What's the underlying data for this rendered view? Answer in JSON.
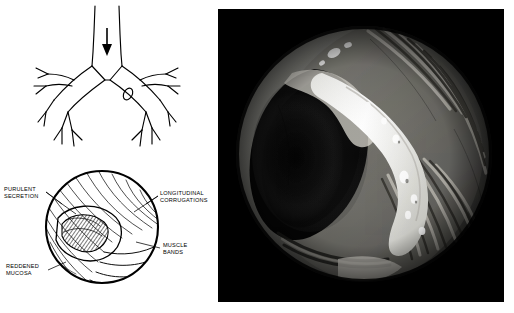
{
  "figure": {
    "caption": "",
    "panels": {
      "left": {
        "name": "schematic-diagram-panel",
        "upper": {
          "name": "tracheobronchial-tree-schematic",
          "description": "Line drawing of trachea with bifurcation into main bronchi and branching lobar bronchi; a downward arrow marks the lower trachea, and a small oval marks a site on the right main bronchus",
          "arrow_label": "",
          "marker_label": ""
        },
        "lower": {
          "name": "circular-detail-inset",
          "description": "Circular magnified view of the bronchial lumen showing mucosal detail",
          "labels": [
            {
              "id": "purulent-secretion",
              "text": "PURULENT\nSECRETION"
            },
            {
              "id": "longitudinal-corrugations",
              "text": "LONGITUDINAL\nCORRUGATIONS"
            },
            {
              "id": "muscle-bands",
              "text": "MUSCLE\nBANDS"
            },
            {
              "id": "reddened-mucosa",
              "text": "REDDENED\nMUCOSA"
            }
          ]
        }
      },
      "right": {
        "name": "endoscopic-photograph-panel",
        "description": "Black-and-white endoscopic photograph in a circular field showing bronchial lumen with longitudinal mucosal corrugations and a bright band of secretion crossing the field",
        "background_color": "#000000",
        "field_shape": "circle"
      }
    }
  }
}
